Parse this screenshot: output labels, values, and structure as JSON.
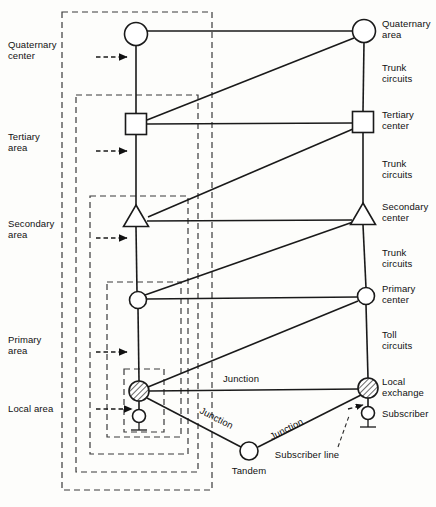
{
  "figure": {
    "type": "telecommunications-network-hierarchy-diagram",
    "background_color": "#fdfdfb",
    "line_color": "#1a1a1a",
    "dash_color": "#3a3a3a"
  },
  "left_labels": [
    {
      "id": "quaternary-center",
      "line1": "Quaternary",
      "line2": "center",
      "x": 8,
      "y": 48,
      "arrow_y": 57,
      "arrow_x1": 96,
      "arrow_x2": 128
    },
    {
      "id": "tertiary-area",
      "line1": "Tertiary",
      "line2": "area",
      "x": 8,
      "y": 138,
      "arrow_y": 151,
      "arrow_x1": 96,
      "arrow_x2": 128
    },
    {
      "id": "secondary-area",
      "line1": "Secondary",
      "line2": "area",
      "x": 8,
      "y": 225,
      "arrow_y": 238,
      "arrow_x1": 96,
      "arrow_x2": 128
    },
    {
      "id": "primary-area",
      "line1": "Primary",
      "line2": "area",
      "x": 8,
      "y": 341,
      "arrow_y": 352,
      "arrow_x1": 96,
      "arrow_x2": 128
    },
    {
      "id": "local-area",
      "line1": "Local area",
      "line2": "",
      "x": 8,
      "y": 412,
      "arrow_y": 409,
      "arrow_x1": 96,
      "arrow_x2": 132
    }
  ],
  "right_labels": [
    {
      "id": "quaternary-area",
      "line1": "Quaternary",
      "line2": "area",
      "x": 382,
      "y": 27
    },
    {
      "id": "trunk-circuits-1",
      "line1": "Trunk",
      "line2": "circuits",
      "x": 382,
      "y": 71
    },
    {
      "id": "tertiary-center",
      "line1": "Tertiary",
      "line2": "center",
      "x": 382,
      "y": 118
    },
    {
      "id": "trunk-circuits-2",
      "line1": "Trunk",
      "line2": "circuits",
      "x": 382,
      "y": 167
    },
    {
      "id": "secondary-center",
      "line1": "Secondary",
      "line2": "center",
      "x": 382,
      "y": 210
    },
    {
      "id": "trunk-circuits-3",
      "line1": "Trunk",
      "line2": "circuits",
      "x": 382,
      "y": 256
    },
    {
      "id": "primary-center",
      "line1": "Primary",
      "line2": "center",
      "x": 382,
      "y": 292
    },
    {
      "id": "toll-circuits",
      "line1": "Toll",
      "line2": "circuits",
      "x": 382,
      "y": 338
    },
    {
      "id": "local-exchange",
      "line1": "Local",
      "line2": "exchange",
      "x": 382,
      "y": 385
    },
    {
      "id": "subscriber",
      "line1": "Subscriber",
      "line2": "",
      "x": 382,
      "y": 417
    }
  ],
  "inline_labels": [
    {
      "id": "junction-horizontal",
      "text": "Junction",
      "x": 241,
      "y": 382,
      "rotate": 0
    },
    {
      "id": "junction-left-diagonal",
      "text": "Junction",
      "x": 215,
      "y": 421,
      "rotate": 27
    },
    {
      "id": "junction-right-diagonal",
      "text": "Junction",
      "x": 288,
      "y": 432,
      "rotate": -27
    },
    {
      "id": "tandem",
      "text": "Tandem",
      "x": 249,
      "y": 473,
      "rotate": 0
    },
    {
      "id": "subscriber-line",
      "text": "Subscriber line",
      "x": 307,
      "y": 456,
      "rotate": 0
    }
  ],
  "nodes": [
    {
      "id": "quaternary-center-left",
      "shape": "circle",
      "cx": 136,
      "cy": 34,
      "r": 11.5
    },
    {
      "id": "quaternary-center-right",
      "shape": "circle",
      "cx": 364,
      "cy": 31,
      "r": 11.5
    },
    {
      "id": "tertiary-center-left",
      "shape": "square",
      "cx": 136,
      "cy": 124,
      "size": 21
    },
    {
      "id": "tertiary-center-right",
      "shape": "square",
      "cx": 363,
      "cy": 122,
      "size": 21
    },
    {
      "id": "secondary-center-left",
      "shape": "triangle",
      "cx": 136,
      "cy": 216,
      "size": 22
    },
    {
      "id": "secondary-center-right",
      "shape": "triangle",
      "cx": 363,
      "cy": 214,
      "size": 22
    },
    {
      "id": "primary-center-left",
      "shape": "circle",
      "cx": 138,
      "cy": 300,
      "r": 8.5
    },
    {
      "id": "primary-center-right",
      "shape": "circle",
      "cx": 366,
      "cy": 296,
      "r": 8.5
    },
    {
      "id": "local-exchange-left",
      "shape": "hatched-circle",
      "cx": 139,
      "cy": 391,
      "r": 10
    },
    {
      "id": "local-exchange-right",
      "shape": "hatched-circle",
      "cx": 368,
      "cy": 388,
      "r": 10
    },
    {
      "id": "tandem-exchange",
      "shape": "circle",
      "cx": 249,
      "cy": 451,
      "r": 9
    },
    {
      "id": "subscriber-left",
      "shape": "telephone",
      "cx": 139,
      "cy": 416
    },
    {
      "id": "subscriber-right",
      "shape": "telephone",
      "cx": 368,
      "cy": 413
    }
  ],
  "dashed_boxes": [
    {
      "id": "quaternary-area-box",
      "x": 62,
      "y": 12,
      "width": 150,
      "height": 478
    },
    {
      "id": "tertiary-area-box",
      "x": 76,
      "y": 95,
      "width": 122,
      "height": 377
    },
    {
      "id": "secondary-area-box",
      "x": 90,
      "y": 196,
      "width": 98,
      "height": 258
    },
    {
      "id": "primary-area-box",
      "x": 107,
      "y": 282,
      "width": 74,
      "height": 155
    },
    {
      "id": "local-area-box",
      "x": 124,
      "y": 369,
      "width": 40,
      "height": 63
    }
  ],
  "legend_note": {
    "subscriber_line_arrow_from": "Subscriber line",
    "subscriber_line_arrow_to": "local-exchange-right"
  }
}
